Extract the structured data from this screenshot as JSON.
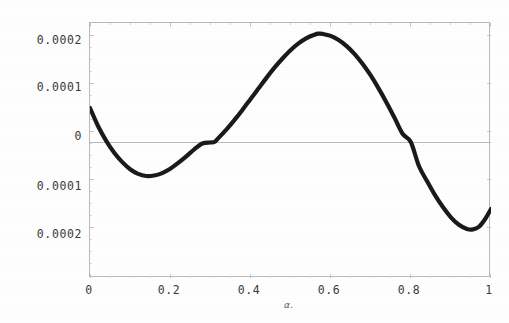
{
  "chart_data": {
    "type": "line",
    "title": "",
    "subtitle": "",
    "xlabel": "α.",
    "ylabel": "",
    "xlim": [
      0,
      1
    ],
    "ylim": [
      -0.00028,
      0.000245
    ],
    "grid": false,
    "legend": null,
    "legend_position": "none",
    "zero_reference_line": true,
    "line_color": "#1a1a1a",
    "line_width_px": 4.2,
    "frame_color": "#b9b9b9",
    "background_color": "#fefefe",
    "xticks": [
      {
        "value": 0,
        "label": "0"
      },
      {
        "value": 0.2,
        "label": "0.2"
      },
      {
        "value": 0.4,
        "label": "0.4"
      },
      {
        "value": 0.6,
        "label": "0.6"
      },
      {
        "value": 0.8,
        "label": "0.8"
      },
      {
        "value": 1,
        "label": "1"
      }
    ],
    "yticks": [
      {
        "value": 0.0002,
        "label": "0.0002"
      },
      {
        "value": 0.0001,
        "label": "0.0001"
      },
      {
        "value": 0,
        "label": "0"
      },
      {
        "value": -0.0001,
        "label": "0.0001"
      },
      {
        "value": -0.0002,
        "label": "0.0002"
      }
    ],
    "series": [
      {
        "name": "curve",
        "x": [
          0.0,
          0.02,
          0.04,
          0.06,
          0.08,
          0.1,
          0.12,
          0.14,
          0.16,
          0.18,
          0.2,
          0.22,
          0.24,
          0.26,
          0.28,
          0.3,
          0.31,
          0.32,
          0.34,
          0.36,
          0.38,
          0.4,
          0.42,
          0.44,
          0.46,
          0.48,
          0.5,
          0.52,
          0.54,
          0.56,
          0.57,
          0.58,
          0.6,
          0.62,
          0.64,
          0.66,
          0.68,
          0.7,
          0.72,
          0.74,
          0.76,
          0.78,
          0.8,
          0.82,
          0.84,
          0.86,
          0.88,
          0.9,
          0.92,
          0.94,
          0.955,
          0.97,
          0.985,
          1.0
        ],
        "y": [
          7e-05,
          3.3e-05,
          3e-06,
          -2.15e-05,
          -4.1e-05,
          -5.6e-05,
          -6.55e-05,
          -7e-05,
          -6.9e-05,
          -6.4e-05,
          -5.5e-05,
          -4.3e-05,
          -2.95e-05,
          -1.5e-05,
          -3e-06,
          -1e-06,
          0.0,
          8e-06,
          2.55e-05,
          4.5e-05,
          6.6e-05,
          8.8e-05,
          0.00011,
          0.000132,
          0.000153,
          0.000172,
          0.000189,
          0.000203,
          0.000214,
          0.000221,
          0.000223,
          0.0002225,
          0.0002185,
          0.00021,
          0.0001975,
          0.000181,
          0.0001605,
          0.000137,
          0.00011,
          8.05e-05,
          4.9e-05,
          1.65e-05,
          0.0,
          -4.9e-05,
          -8e-05,
          -0.000109,
          -0.000134,
          -0.000155,
          -0.0001705,
          -0.000179,
          -0.00018,
          -0.0001745,
          -0.000159,
          -0.000138
        ],
        "notable_points": {
          "start": {
            "x": 0,
            "y": 7e-05
          },
          "first_minimum": {
            "x": 0.14,
            "y": -0.00017
          },
          "first_zero_crossing": {
            "x": 0.31,
            "y": 0
          },
          "maximum": {
            "x": 0.57,
            "y": 0.000223
          },
          "second_zero_crossing": {
            "x": 0.8,
            "y": 0
          },
          "second_minimum": {
            "x": 0.955,
            "y": -0.00027
          },
          "end": {
            "x": 1.0,
            "y": -0.00022
          }
        }
      }
    ]
  }
}
